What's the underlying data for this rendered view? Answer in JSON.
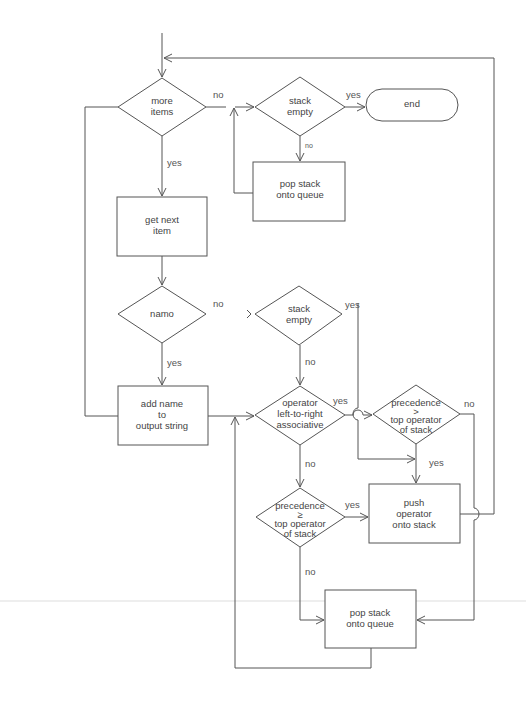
{
  "diagram": {
    "type": "flowchart",
    "nodes": {
      "more_items": {
        "shape": "decision",
        "lines": [
          "more",
          "items"
        ]
      },
      "stack_empty_top": {
        "shape": "decision",
        "lines": [
          "stack",
          "empty"
        ]
      },
      "end": {
        "shape": "terminal",
        "lines": [
          "end"
        ]
      },
      "pop_top": {
        "shape": "process",
        "lines": [
          "pop stack",
          "onto queue"
        ]
      },
      "get_next": {
        "shape": "process",
        "lines": [
          "get next",
          "item"
        ]
      },
      "name_check": {
        "shape": "decision",
        "lines": [
          "namo"
        ]
      },
      "stack_empty_mid": {
        "shape": "decision",
        "lines": [
          "stack",
          "empty"
        ]
      },
      "add_name": {
        "shape": "process",
        "lines": [
          "add name",
          "to",
          "output string"
        ]
      },
      "op_ltr": {
        "shape": "decision",
        "lines": [
          "operator",
          "left-to-right",
          "associative"
        ]
      },
      "prec_gt": {
        "shape": "decision",
        "lines": [
          "precedence",
          ">",
          "top operator",
          "of stack"
        ]
      },
      "prec_ge": {
        "shape": "decision",
        "lines": [
          "precedence",
          "≥",
          "top operator",
          "of stack"
        ]
      },
      "push_op": {
        "shape": "process",
        "lines": [
          "push",
          "operator",
          "onto stack"
        ]
      },
      "pop_bottom": {
        "shape": "process",
        "lines": [
          "pop stack",
          "onto queue"
        ]
      }
    },
    "edge_labels": {
      "more_items_no": "no",
      "more_items_yes": "yes",
      "stack_empty_top_yes": "yes",
      "stack_empty_top_no": "no",
      "name_no": "no",
      "name_yes": "yes",
      "stack_empty_mid_yes": "yes",
      "stack_empty_mid_no": "no",
      "op_ltr_yes": "yes",
      "op_ltr_no": "no",
      "prec_gt_no": "no",
      "prec_gt_yes": "yes",
      "prec_ge_yes": "yes",
      "prec_ge_no": "no"
    },
    "edges": [
      {
        "from": "start",
        "to": "more_items"
      },
      {
        "from": "more_items",
        "to": "stack_empty_top",
        "label": "no"
      },
      {
        "from": "more_items",
        "to": "get_next",
        "label": "yes"
      },
      {
        "from": "stack_empty_top",
        "to": "end",
        "label": "yes"
      },
      {
        "from": "stack_empty_top",
        "to": "pop_top",
        "label": "no"
      },
      {
        "from": "pop_top",
        "to": "stack_empty_top"
      },
      {
        "from": "get_next",
        "to": "name_check"
      },
      {
        "from": "name_check",
        "to": "stack_empty_mid",
        "label": "no"
      },
      {
        "from": "name_check",
        "to": "add_name",
        "label": "yes"
      },
      {
        "from": "add_name",
        "to": "more_items"
      },
      {
        "from": "stack_empty_mid",
        "to": "push_op",
        "label": "yes"
      },
      {
        "from": "stack_empty_mid",
        "to": "op_ltr",
        "label": "no"
      },
      {
        "from": "op_ltr",
        "to": "prec_gt",
        "label": "yes"
      },
      {
        "from": "op_ltr",
        "to": "prec_ge",
        "label": "no"
      },
      {
        "from": "prec_gt",
        "to": "push_op",
        "label": "yes"
      },
      {
        "from": "prec_gt",
        "to": "pop_bottom",
        "label": "no"
      },
      {
        "from": "prec_ge",
        "to": "push_op",
        "label": "yes"
      },
      {
        "from": "prec_ge",
        "to": "pop_bottom",
        "label": "no"
      },
      {
        "from": "push_op",
        "to": "more_items"
      },
      {
        "from": "pop_bottom",
        "to": "op_ltr"
      }
    ]
  }
}
